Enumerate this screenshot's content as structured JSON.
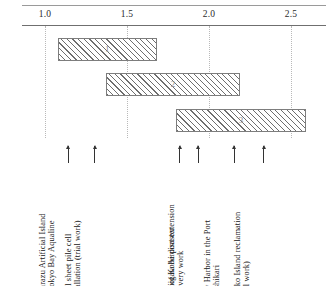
{
  "chart_data": {
    "type": "bar",
    "orientation": "horizontal",
    "title": "",
    "xlabel": "",
    "ylabel": "",
    "xlim": [
      0.8,
      2.65
    ],
    "grid": true,
    "legend": "none",
    "axis_ticks": [
      {
        "label": "1.0",
        "value": 1.0
      },
      {
        "label": "1.5",
        "value": 1.5
      },
      {
        "label": "2.0",
        "value": 2.0
      },
      {
        "label": "2.5",
        "value": 2.5
      }
    ],
    "bars": [
      {
        "id": "1",
        "label": "1",
        "start": 1.08,
        "end": 1.68
      },
      {
        "id": "2",
        "label": "2",
        "start": 1.37,
        "end": 2.19
      },
      {
        "id": "3",
        "label": "3",
        "start": 1.8,
        "end": 2.59
      }
    ],
    "annotations": [
      {
        "id": "kisarazu-artificial-island",
        "value": 1.14,
        "lines": [
          "Kisarazu Artificial Island",
          "of Tokyo Bay Aqualine"
        ]
      },
      {
        "id": "steel-sheet-pile-cell",
        "value": 1.3,
        "lines": [
          "Steel sheet pile cell",
          "installation (trial work)"
        ]
      },
      {
        "id": "niigata-airport-extension",
        "value": 1.82,
        "lines": [
          "Niigata Airport extension"
        ]
      },
      {
        "id": "port-of-kobe-disaster",
        "value": 1.93,
        "lines": [
          "Port of Kobe disaster",
          "recovery work"
        ]
      },
      {
        "id": "new-harbor-port-of-ishikari",
        "value": 2.15,
        "lines": [
          "New Harbor in the Port",
          "of Ishikari"
        ]
      },
      {
        "id": "rokko-island-reclamation",
        "value": 2.33,
        "lines": [
          "Rokko Island reclamation",
          "(trial work)"
        ]
      }
    ]
  },
  "colors": {
    "axis": "#6f6f6f",
    "grid": "#b9b9b9",
    "bar_outline": "#7d7d7d",
    "bar_hatch": "#6e6e6e",
    "text": "#141414"
  }
}
